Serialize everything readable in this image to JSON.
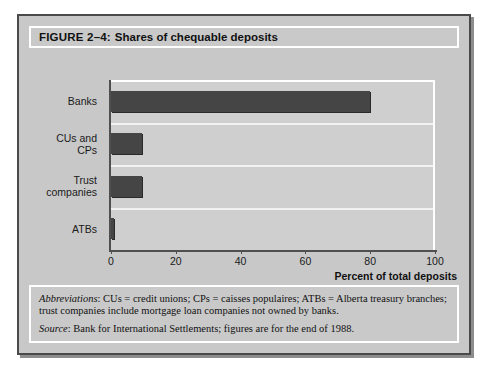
{
  "figure": {
    "number_label": "FIGURE 2–4:",
    "title": "Shares of chequable deposits"
  },
  "notes": {
    "abbrev_label": "Abbreviations",
    "abbrev_text": ": CUs =  credit unions; CPs =  caisses populaires; ATBs = Alberta treasury branches; trust companies include mortgage loan companies not owned by banks.",
    "source_label": "Source",
    "source_text": ": Bank for International Settlements; figures are for the end of 1988."
  },
  "colors": {
    "bar": "#454545",
    "panel": "#c8c8c8",
    "plot_bg": "#cfcfcf",
    "gridline": "#f2f2f2",
    "axis": "#4f4f4f",
    "frame": "#4a4a4a"
  },
  "chart_data": {
    "type": "bar",
    "orientation": "horizontal",
    "title": "Shares of chequable deposits",
    "xlabel": "Percent of total deposits",
    "ylabel": "",
    "categories": [
      "Banks",
      "CUs and CPs",
      "Trust companies",
      "ATBs"
    ],
    "category_lines": [
      [
        "Banks"
      ],
      [
        "CUs and",
        "CPs"
      ],
      [
        "Trust",
        "companies"
      ],
      [
        "ATBs"
      ]
    ],
    "values": [
      80,
      9.5,
      9.5,
      1
    ],
    "xlim": [
      0,
      100
    ],
    "xticks": [
      0,
      20,
      40,
      60,
      80,
      100
    ],
    "xtick_labels": [
      "0",
      "20",
      "40",
      "60",
      "80",
      "100"
    ],
    "grid": "horizontal",
    "legend": "none",
    "series": [
      {
        "name": "Share of chequable deposits",
        "values": [
          80,
          9.5,
          9.5,
          1
        ]
      }
    ]
  }
}
